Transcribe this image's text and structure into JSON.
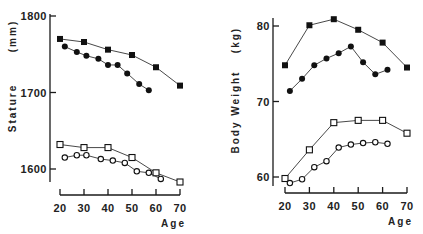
{
  "chart_data": [
    {
      "type": "line",
      "title": "",
      "xlabel": "Age",
      "ylabel": "Stature",
      "yunit": "(mm)",
      "xticks": [
        20,
        30,
        40,
        50,
        60,
        70
      ],
      "yticks": [
        1600,
        1700,
        1800
      ],
      "xlim": [
        20,
        70
      ],
      "ylim": [
        1580,
        1800
      ],
      "grid": false,
      "legend": null,
      "series": [
        {
          "name": "filled-square",
          "marker": "square-filled",
          "x": [
            20,
            30,
            40,
            50,
            60,
            70
          ],
          "values": [
            1770,
            1766,
            1756,
            1749,
            1733,
            1709
          ]
        },
        {
          "name": "filled-circle",
          "marker": "circle-filled",
          "x": [
            22,
            27,
            31,
            36,
            40,
            44,
            48,
            53,
            57
          ],
          "values": [
            1760,
            1753,
            1748,
            1744,
            1736,
            1736,
            1725,
            1711,
            1703
          ]
        },
        {
          "name": "open-square",
          "marker": "square-open",
          "x": [
            20,
            30,
            40,
            50,
            60,
            70
          ],
          "values": [
            1632,
            1628,
            1628,
            1615,
            1595,
            1583
          ]
        },
        {
          "name": "open-circle",
          "marker": "circle-open",
          "x": [
            22,
            27,
            31,
            37,
            42,
            47,
            52,
            57,
            62
          ],
          "values": [
            1615,
            1618,
            1618,
            1613,
            1611,
            1608,
            1597,
            1595,
            1587
          ]
        }
      ]
    },
    {
      "type": "line",
      "title": "",
      "xlabel": "Age",
      "ylabel": "Body Weight",
      "yunit": "(kg)",
      "xticks": [
        20,
        30,
        40,
        50,
        60,
        70
      ],
      "yticks": [
        60,
        70,
        80
      ],
      "xlim": [
        20,
        70
      ],
      "ylim": [
        59,
        82
      ],
      "grid": false,
      "legend": null,
      "series": [
        {
          "name": "filled-square",
          "marker": "square-filled",
          "x": [
            20,
            30,
            40,
            50,
            60,
            70
          ],
          "values": [
            74.8,
            80.1,
            80.9,
            79.5,
            77.8,
            74.5
          ]
        },
        {
          "name": "filled-circle",
          "marker": "circle-filled",
          "x": [
            22,
            27,
            32,
            37,
            42,
            47,
            52,
            57,
            62
          ],
          "values": [
            71.4,
            73.0,
            74.8,
            75.7,
            76.4,
            77.3,
            75.2,
            73.6,
            74.2
          ]
        },
        {
          "name": "open-square",
          "marker": "square-open",
          "x": [
            20,
            30,
            40,
            50,
            60,
            70
          ],
          "values": [
            59.8,
            63.6,
            67.2,
            67.5,
            67.5,
            65.8
          ]
        },
        {
          "name": "open-circle",
          "marker": "circle-open",
          "x": [
            22,
            27,
            32,
            37,
            42,
            47,
            52,
            57,
            62
          ],
          "values": [
            59.2,
            59.7,
            61.3,
            62.1,
            63.9,
            64.3,
            64.5,
            64.6,
            64.4
          ]
        }
      ]
    }
  ],
  "layout": [
    {
      "x0": 60,
      "xpx": 2.4,
      "yref": 1600,
      "yrefpx": 169,
      "ypx": 0.765,
      "yaxis_x": 50,
      "yaxis_top": 14,
      "yaxis_bottom": 182,
      "xaxis_y": 195,
      "xaxis_left": 60,
      "xaxis_right": 180
    },
    {
      "x0": 285,
      "xpx": 2.44,
      "yref": 60,
      "yrefpx": 177,
      "ypx": 7.55,
      "yaxis_x": 273,
      "yaxis_top": 18,
      "yaxis_bottom": 186,
      "xaxis_y": 193,
      "xaxis_left": 285,
      "xaxis_right": 407
    }
  ]
}
